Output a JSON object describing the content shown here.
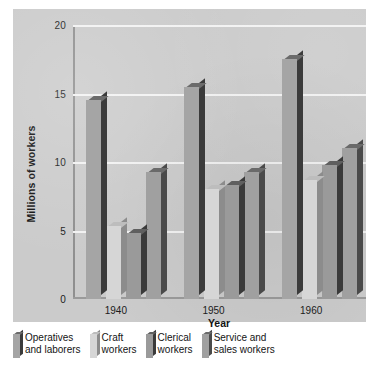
{
  "chart_data": {
    "type": "bar",
    "title": "",
    "xlabel": "Year",
    "ylabel": "Millions of workers",
    "categories": [
      "1940",
      "1950",
      "1960"
    ],
    "ylim": [
      0,
      20
    ],
    "yticks": [
      "0",
      "5",
      "10",
      "15",
      "20"
    ],
    "grid": true,
    "grid_color": "#f2f2f2",
    "plot_background": "#cbcbcb",
    "legend_position": "below",
    "series": [
      {
        "name": "Operatives\nand laborers",
        "values": [
          14.5,
          15.5,
          17.5
        ],
        "color": "#a5a5a5"
      },
      {
        "name": "Craft\nworkers",
        "values": [
          5.3,
          8.0,
          8.7
        ],
        "color": "#d6d6d6"
      },
      {
        "name": "Clerical\nworkers",
        "values": [
          4.8,
          8.3,
          9.8
        ],
        "color": "#9a9a9a"
      },
      {
        "name": "Service and\nsales workers",
        "values": [
          9.3,
          9.3,
          11.0
        ],
        "color": "#a0a0a0"
      }
    ]
  }
}
